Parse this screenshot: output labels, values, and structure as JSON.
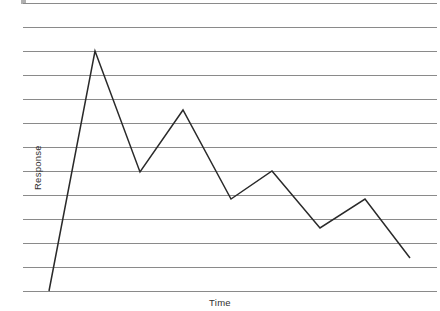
{
  "figure": {
    "width": 440,
    "height": 311,
    "background": "#ffffff",
    "artifact_label": "scan-speck"
  },
  "chart_data": {
    "type": "line",
    "title": "",
    "subtitle": "",
    "xlabel": "Time",
    "ylabel": "Response",
    "grid": true,
    "grid_orientation": "horizontal",
    "grid_line_count": 13,
    "legend": null,
    "legend_position": "none",
    "annotations": [],
    "xticklabels": [],
    "yticklabels": [],
    "xlim": [
      0,
      8
    ],
    "ylim": [
      0,
      12
    ],
    "x": [
      0,
      1,
      2,
      3,
      4,
      5,
      6,
      7,
      8
    ],
    "series": [
      {
        "name": "Response",
        "color": "#2a2a2a",
        "line_width": 1.5,
        "markers": false,
        "values": [
          0,
          10,
          4.95,
          7.55,
          3.85,
          5.0,
          2.65,
          3.85,
          1.4
        ]
      }
    ],
    "pixel_geometry": {
      "note": "polyline vertices measured in image pixel coordinates",
      "grid_y": [
        3,
        27,
        51,
        75,
        99,
        123,
        147,
        171,
        195,
        219,
        243,
        267,
        291
      ],
      "grid_x_start": 23,
      "grid_x_end": 437,
      "grid_color": "#8a8a8a",
      "baseline_y": 291,
      "points": [
        [
          49,
          291
        ],
        [
          95,
          51
        ],
        [
          140,
          172
        ],
        [
          183,
          110
        ],
        [
          231,
          199
        ],
        [
          272,
          171
        ],
        [
          320,
          228
        ],
        [
          365,
          199
        ],
        [
          410,
          258
        ]
      ]
    }
  },
  "labels": {
    "y_axis": "Response",
    "x_axis": "Time"
  }
}
